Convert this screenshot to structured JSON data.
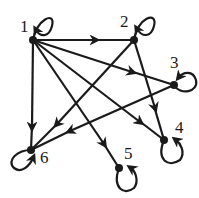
{
  "diagram": {
    "type": "directed-graph",
    "nodes": [
      {
        "id": "1",
        "label": "1",
        "x": 33,
        "y": 40
      },
      {
        "id": "2",
        "label": "2",
        "x": 134,
        "y": 40
      },
      {
        "id": "3",
        "label": "3",
        "x": 174,
        "y": 85
      },
      {
        "id": "4",
        "label": "4",
        "x": 164,
        "y": 140
      },
      {
        "id": "5",
        "label": "5",
        "x": 119,
        "y": 168
      },
      {
        "id": "6",
        "label": "6",
        "x": 31,
        "y": 150
      }
    ],
    "edges": [
      {
        "from": "1",
        "to": "1"
      },
      {
        "from": "1",
        "to": "2"
      },
      {
        "from": "1",
        "to": "3"
      },
      {
        "from": "1",
        "to": "4"
      },
      {
        "from": "1",
        "to": "5"
      },
      {
        "from": "1",
        "to": "6"
      },
      {
        "from": "2",
        "to": "2"
      },
      {
        "from": "2",
        "to": "4"
      },
      {
        "from": "2",
        "to": "6"
      },
      {
        "from": "3",
        "to": "3"
      },
      {
        "from": "3",
        "to": "6"
      },
      {
        "from": "4",
        "to": "4"
      },
      {
        "from": "5",
        "to": "5"
      },
      {
        "from": "6",
        "to": "6"
      }
    ],
    "colors": {
      "ink": "#1a1a1a",
      "background": "#ffffff"
    }
  }
}
